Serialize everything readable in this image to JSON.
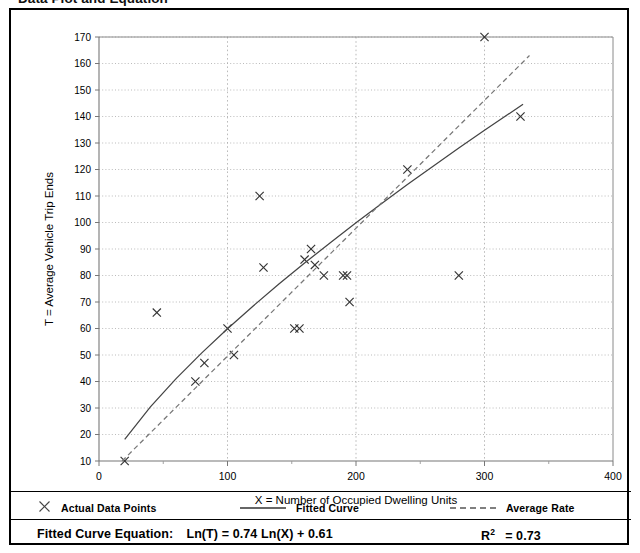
{
  "page": {
    "title": "Data Plot and Equation"
  },
  "legend": {
    "items": [
      {
        "label": "Actual Data Points",
        "marker": "cross-marker-icon",
        "color": "#444444"
      },
      {
        "label": "Fitted Curve",
        "marker": "solid-line-icon",
        "color": "#444444"
      },
      {
        "label": "Average Rate",
        "marker": "dashed-line-icon",
        "color": "#666666"
      }
    ]
  },
  "equation": {
    "label": "Fitted Curve Equation:",
    "formula": "Ln(T) = 0.74 Ln(X) + 0.61",
    "r_squared_symbol": "R",
    "r_squared_exponent": "2",
    "r_squared_value": "= 0.73"
  },
  "chart_data": {
    "type": "scatter",
    "title": "Data Plot and Equation",
    "xlabel": "X = Number of Occupied Dwelling Units",
    "ylabel": "T = Average Vehicle Trip Ends",
    "xlim": [
      0,
      400
    ],
    "ylim": [
      10,
      170
    ],
    "xticks": [
      0,
      100,
      200,
      300,
      400
    ],
    "xtick_labels": [
      "0",
      "100",
      "200",
      "300",
      "400"
    ],
    "yticks": [
      10,
      20,
      30,
      40,
      50,
      60,
      70,
      80,
      90,
      100,
      110,
      120,
      130,
      140,
      150,
      160,
      170
    ],
    "ytick_labels": [
      "10",
      "20",
      "30",
      "40",
      "50",
      "60",
      "70",
      "80",
      "90",
      "100",
      "110",
      "120",
      "130",
      "140",
      "150",
      "160",
      "170"
    ],
    "x_minor_tick_step": 50,
    "grid": true,
    "grid_style": "dotted",
    "grid_color": "#aaaaaa",
    "legend_position": "below-plot",
    "series": [
      {
        "name": "Actual Data Points",
        "type": "scatter",
        "marker": "x",
        "color": "#333333",
        "points": [
          [
            20,
            10
          ],
          [
            45,
            66
          ],
          [
            75,
            40
          ],
          [
            82,
            47
          ],
          [
            100,
            60
          ],
          [
            105,
            50
          ],
          [
            125,
            110
          ],
          [
            128,
            83
          ],
          [
            152,
            60
          ],
          [
            156,
            60
          ],
          [
            160,
            86
          ],
          [
            165,
            90
          ],
          [
            168,
            84
          ],
          [
            175,
            80
          ],
          [
            190,
            80
          ],
          [
            193,
            80
          ],
          [
            195,
            70
          ],
          [
            240,
            120
          ],
          [
            280,
            80
          ],
          [
            300,
            170
          ],
          [
            328,
            140
          ]
        ]
      },
      {
        "name": "Fitted Curve",
        "type": "line",
        "style": "solid",
        "color": "#444444",
        "equation": "Ln(T) = 0.74 Ln(X) + 0.61",
        "r_squared": 0.73,
        "x_range": [
          20,
          330
        ],
        "points": [
          [
            20,
            18.2
          ],
          [
            40,
            30.4
          ],
          [
            60,
            41.1
          ],
          [
            80,
            50.8
          ],
          [
            100,
            59.9
          ],
          [
            120,
            68.5
          ],
          [
            140,
            76.8
          ],
          [
            160,
            84.7
          ],
          [
            180,
            92.4
          ],
          [
            200,
            99.9
          ],
          [
            220,
            107.2
          ],
          [
            240,
            114.3
          ],
          [
            260,
            121.2
          ],
          [
            280,
            128.1
          ],
          [
            300,
            134.8
          ],
          [
            330,
            144.6
          ]
        ]
      },
      {
        "name": "Average Rate",
        "type": "line",
        "style": "dashed",
        "color": "#777777",
        "x_range": [
          18,
          335
        ],
        "points": [
          [
            18,
            10
          ],
          [
            335,
            163
          ]
        ]
      }
    ]
  }
}
